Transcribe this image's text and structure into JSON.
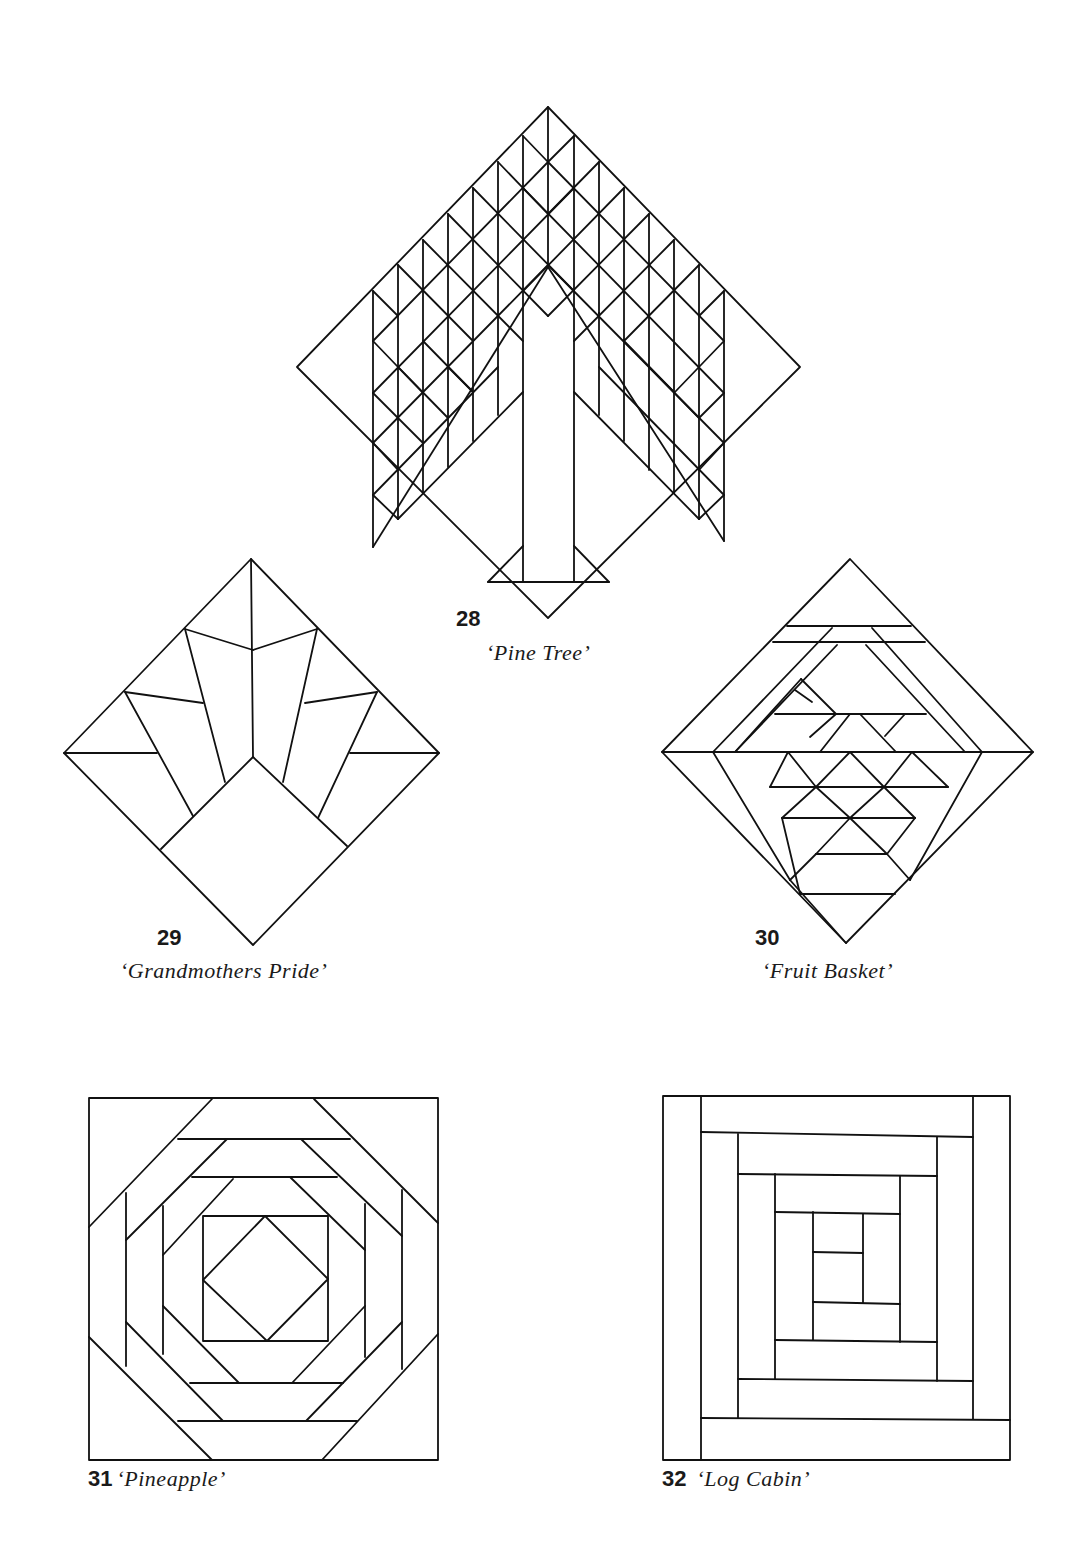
{
  "page": {
    "background": "#ffffff",
    "line_color": "#111111"
  },
  "figures": [
    {
      "number": "28",
      "title": "‘Pine Tree’",
      "shape": "diamond"
    },
    {
      "number": "29",
      "title": "‘Grandmothers Pride’",
      "shape": "diamond"
    },
    {
      "number": "30",
      "title": "‘Fruit Basket’",
      "shape": "diamond"
    },
    {
      "number": "31",
      "title": "‘Pineapple’",
      "shape": "square"
    },
    {
      "number": "32",
      "title": "‘Log Cabin’",
      "shape": "square"
    }
  ]
}
